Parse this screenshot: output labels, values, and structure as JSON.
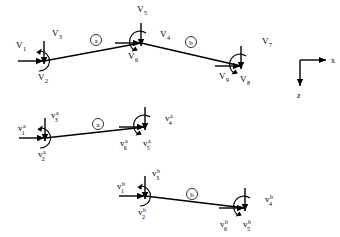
{
  "figure": {
    "background_color": "#ffffff",
    "line_color": "#000000",
    "stroke_width": 1.4
  },
  "axes": {
    "x_label": "x",
    "z_label": "z",
    "origin": [
      300,
      60
    ],
    "x_end": [
      328,
      60
    ],
    "z_end": [
      300,
      88
    ]
  },
  "structures": [
    {
      "name": "global-structure",
      "elements": [
        {
          "id": "a",
          "label": "a",
          "from": [
            44,
            61
          ],
          "to": [
            141,
            43
          ],
          "badge": [
            96,
            40
          ]
        },
        {
          "id": "b",
          "label": "b",
          "from": [
            141,
            43
          ],
          "to": [
            241,
            66
          ],
          "badge": [
            191,
            42
          ]
        }
      ],
      "forces": [
        {
          "name": "V1",
          "label": "V",
          "sub": "1",
          "type": "force",
          "dir": "right",
          "tip": [
            44,
            61
          ],
          "text": [
            16,
            48
          ]
        },
        {
          "name": "V2",
          "label": "V",
          "sub": "2",
          "type": "force",
          "dir": "down",
          "tip": [
            44,
            61
          ],
          "text": [
            38,
            80
          ]
        },
        {
          "name": "V3",
          "label": "V",
          "sub": "3",
          "type": "moment",
          "dir": "cw",
          "tip": [
            44,
            61
          ],
          "text": [
            52,
            36
          ]
        },
        {
          "name": "V4",
          "label": "V",
          "sub": "4",
          "type": "force",
          "dir": "right",
          "tip": [
            141,
            43
          ],
          "text": [
            160,
            37
          ]
        },
        {
          "name": "V5",
          "label": "V",
          "sub": "5",
          "type": "force",
          "dir": "down",
          "tip": [
            141,
            43
          ],
          "text": [
            137,
            12
          ]
        },
        {
          "name": "V6",
          "label": "V",
          "sub": "6",
          "type": "moment",
          "dir": "ccw",
          "tip": [
            141,
            43
          ],
          "text": [
            128,
            59
          ]
        },
        {
          "name": "V7",
          "label": "V",
          "sub": "7",
          "type": "force",
          "dir": "right",
          "tip": [
            241,
            66
          ],
          "text": [
            262,
            44
          ]
        },
        {
          "name": "V8",
          "label": "V",
          "sub": "8",
          "type": "force",
          "dir": "down",
          "tip": [
            241,
            66
          ],
          "text": [
            240,
            82
          ]
        },
        {
          "name": "V9",
          "label": "V",
          "sub": "9",
          "type": "moment",
          "dir": "ccw",
          "tip": [
            241,
            66
          ],
          "text": [
            219,
            79
          ]
        }
      ]
    },
    {
      "name": "element-a-free-body",
      "elements": [
        {
          "id": "a",
          "label": "a",
          "from": [
            45,
            138
          ],
          "to": [
            145,
            127
          ],
          "badge": [
            98,
            124
          ]
        }
      ],
      "forces": [
        {
          "name": "v1a",
          "label": "v",
          "sub": "1",
          "sup": "a",
          "type": "force",
          "dir": "right",
          "tip": [
            45,
            138
          ],
          "text": [
            18,
            131
          ]
        },
        {
          "name": "v2a",
          "label": "v",
          "sub": "2",
          "sup": "a",
          "type": "force",
          "dir": "down",
          "tip": [
            45,
            138
          ],
          "text": [
            38,
            157
          ]
        },
        {
          "name": "v3a",
          "label": "v",
          "sub": "3",
          "sup": "a",
          "type": "moment",
          "dir": "cw",
          "tip": [
            45,
            138
          ],
          "text": [
            51,
            118
          ]
        },
        {
          "name": "v4a",
          "label": "v",
          "sub": "4",
          "sup": "a",
          "type": "force",
          "dir": "right",
          "tip": [
            145,
            127
          ],
          "text": [
            165,
            121
          ]
        },
        {
          "name": "v5a",
          "label": "v",
          "sub": "5",
          "sup": "a",
          "type": "force",
          "dir": "down",
          "tip": [
            145,
            127
          ],
          "text": [
            143,
            146
          ]
        },
        {
          "name": "v6a",
          "label": "v",
          "sub": "6",
          "sup": "a",
          "type": "moment",
          "dir": "ccw",
          "tip": [
            145,
            127
          ],
          "text": [
            120,
            146
          ]
        }
      ]
    },
    {
      "name": "element-b-free-body",
      "elements": [
        {
          "id": "b",
          "label": "b",
          "from": [
            145,
            196
          ],
          "to": [
            245,
            208
          ],
          "badge": [
            192,
            194
          ]
        }
      ],
      "forces": [
        {
          "name": "v1b",
          "label": "v",
          "sub": "1",
          "sup": "b",
          "type": "force",
          "dir": "right",
          "tip": [
            145,
            196
          ],
          "text": [
            117,
            189
          ]
        },
        {
          "name": "v2b",
          "label": "v",
          "sub": "2",
          "sup": "b",
          "type": "force",
          "dir": "down",
          "tip": [
            145,
            196
          ],
          "text": [
            138,
            215
          ]
        },
        {
          "name": "v3b",
          "label": "v",
          "sub": "3",
          "sup": "b",
          "type": "moment",
          "dir": "cw",
          "tip": [
            145,
            196
          ],
          "text": [
            152,
            176
          ]
        },
        {
          "name": "v4b",
          "label": "v",
          "sub": "4",
          "sup": "b",
          "type": "force",
          "dir": "right",
          "tip": [
            245,
            208
          ],
          "text": [
            265,
            202
          ]
        },
        {
          "name": "v5b",
          "label": "v",
          "sub": "5",
          "sup": "b",
          "type": "force",
          "dir": "down",
          "tip": [
            245,
            208
          ],
          "text": [
            243,
            227
          ]
        },
        {
          "name": "v6b",
          "label": "v",
          "sub": "6",
          "sup": "b",
          "type": "moment",
          "dir": "ccw",
          "tip": [
            245,
            208
          ],
          "text": [
            220,
            227
          ]
        }
      ]
    }
  ]
}
